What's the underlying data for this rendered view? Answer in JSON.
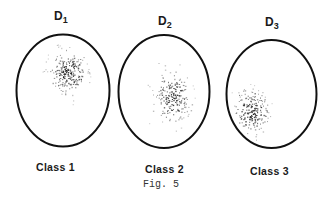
{
  "figure": {
    "caption": "Fig. 5",
    "ellipse_stroke": "#111111",
    "dot_color": "#1a1a1a",
    "panels": [
      {
        "domain_label": "D",
        "domain_sub": "1",
        "class_label": "Class 1",
        "ellipse": {
          "cx": 63,
          "cy": 90.5,
          "rx": 46.5,
          "ry": 56
        },
        "cluster": {
          "cx": 68,
          "cy": 72,
          "sx": 9,
          "sy": 11,
          "n": 230,
          "seed": 11
        }
      },
      {
        "domain_label": "D",
        "domain_sub": "2",
        "class_label": "Class 2",
        "ellipse": {
          "cx": 164,
          "cy": 91.5,
          "rx": 45.5,
          "ry": 56.5
        },
        "cluster": {
          "cx": 172,
          "cy": 98,
          "sx": 9,
          "sy": 12,
          "n": 200,
          "seed": 23
        }
      },
      {
        "domain_label": "D",
        "domain_sub": "3",
        "class_label": "Class 3",
        "ellipse": {
          "cx": 271.5,
          "cy": 94,
          "rx": 45,
          "ry": 54
        },
        "cluster": {
          "cx": 251,
          "cy": 113,
          "sx": 9,
          "sy": 11,
          "n": 200,
          "seed": 37
        }
      }
    ]
  }
}
